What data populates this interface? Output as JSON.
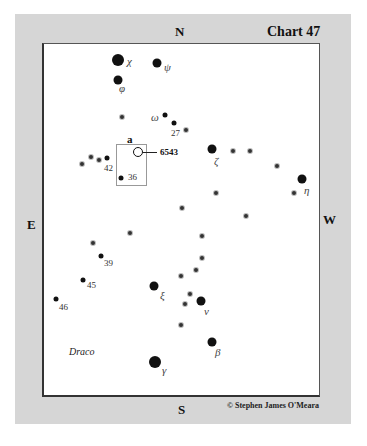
{
  "chart": {
    "title": "Chart 47",
    "directions": {
      "north": "N",
      "south": "S",
      "east": "E",
      "west": "W"
    },
    "constellation": "Draco",
    "credit": "© Stephen James O'Meara",
    "field_label": "a",
    "object": "6543"
  },
  "stars": [
    {
      "name": "chi",
      "label": "χ",
      "x": 118,
      "y": 60,
      "size": "big",
      "lx": 127,
      "ly": 55
    },
    {
      "name": "psi",
      "label": "ψ",
      "x": 157,
      "y": 63,
      "size": "med",
      "lx": 164,
      "ly": 61
    },
    {
      "name": "phi",
      "label": "φ",
      "x": 118,
      "y": 80,
      "size": "med",
      "lx": 119,
      "ly": 82
    },
    {
      "name": "omega",
      "label": "ω",
      "x": 165,
      "y": 115,
      "size": "sm",
      "lx": 151,
      "ly": 111
    },
    {
      "name": "27",
      "label": "27",
      "x": 174,
      "y": 123,
      "size": "sm",
      "lx": 171,
      "ly": 128
    },
    {
      "name": "42",
      "label": "42",
      "x": 107,
      "y": 158,
      "size": "sm",
      "lx": 104,
      "ly": 163
    },
    {
      "name": "36",
      "label": "36",
      "x": 121,
      "y": 178,
      "size": "sm",
      "lx": 128,
      "ly": 172
    },
    {
      "name": "zeta",
      "label": "ζ",
      "x": 212,
      "y": 149,
      "size": "med",
      "lx": 214,
      "ly": 155
    },
    {
      "name": "eta",
      "label": "η",
      "x": 302,
      "y": 179,
      "size": "med",
      "lx": 304,
      "ly": 184
    },
    {
      "name": "39",
      "label": "39",
      "x": 101,
      "y": 256,
      "size": "sm",
      "lx": 104,
      "ly": 258
    },
    {
      "name": "45",
      "label": "45",
      "x": 83,
      "y": 280,
      "size": "sm",
      "lx": 87,
      "ly": 280
    },
    {
      "name": "46",
      "label": "46",
      "x": 56,
      "y": 299,
      "size": "sm",
      "lx": 59,
      "ly": 302
    },
    {
      "name": "xi",
      "label": "ξ",
      "x": 154,
      "y": 286,
      "size": "med",
      "lx": 160,
      "ly": 289
    },
    {
      "name": "nu",
      "label": "ν",
      "x": 201,
      "y": 301,
      "size": "med",
      "lx": 204,
      "ly": 305
    },
    {
      "name": "beta",
      "label": "β",
      "x": 212,
      "y": 342,
      "size": "med",
      "lx": 215,
      "ly": 346
    },
    {
      "name": "gamma",
      "label": "γ",
      "x": 155,
      "y": 362,
      "size": "big",
      "lx": 162,
      "ly": 364
    }
  ],
  "faint_stars": [
    [
      122,
      117
    ],
    [
      186,
      130
    ],
    [
      82,
      164
    ],
    [
      91,
      157
    ],
    [
      99,
      160
    ],
    [
      233,
      151
    ],
    [
      250,
      151
    ],
    [
      277,
      166
    ],
    [
      294,
      193
    ],
    [
      216,
      193
    ],
    [
      246,
      216
    ],
    [
      182,
      208
    ],
    [
      202,
      236
    ],
    [
      130,
      233
    ],
    [
      93,
      243
    ],
    [
      202,
      258
    ],
    [
      196,
      270
    ],
    [
      181,
      276
    ],
    [
      190,
      294
    ],
    [
      185,
      304
    ],
    [
      181,
      325
    ]
  ]
}
